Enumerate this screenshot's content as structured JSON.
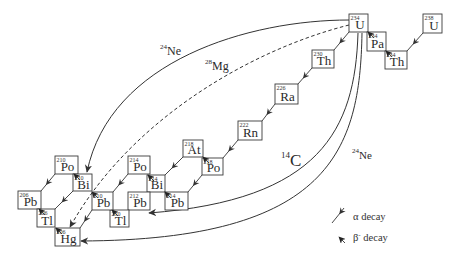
{
  "diagram": {
    "nuclides": [
      {
        "mass": "234",
        "symbol": "U"
      },
      {
        "mass": "234",
        "symbol": "Pa"
      },
      {
        "mass": "234",
        "symbol": "Th"
      },
      {
        "mass": "238",
        "symbol": "U"
      },
      {
        "mass": "230",
        "symbol": "Th"
      },
      {
        "mass": "226",
        "symbol": "Ra"
      },
      {
        "mass": "222",
        "symbol": "Rn"
      },
      {
        "mass": "218",
        "symbol": "At"
      },
      {
        "mass": "218",
        "symbol": "Po"
      },
      {
        "mass": "214",
        "symbol": "Po"
      },
      {
        "mass": "214",
        "symbol": "Bi"
      },
      {
        "mass": "214",
        "symbol": "Pb"
      },
      {
        "mass": "212",
        "symbol": "Pb"
      },
      {
        "mass": "210",
        "symbol": "Tl"
      },
      {
        "mass": "210",
        "symbol": "Pb"
      },
      {
        "mass": "210",
        "symbol": "Po"
      },
      {
        "mass": "210",
        "symbol": "Bi"
      },
      {
        "mass": "206",
        "symbol": "Pb"
      },
      {
        "mass": "206",
        "symbol": "Tl"
      },
      {
        "mass": "206",
        "symbol": "Hg"
      }
    ],
    "cluster_labels": [
      {
        "mass": "24",
        "symbol": "Ne"
      },
      {
        "mass": "28",
        "symbol": "Mg"
      },
      {
        "mass": "14",
        "symbol": "C"
      },
      {
        "mass": "24",
        "symbol": "Ne"
      }
    ],
    "legend": {
      "alpha": {
        "label": "α decay"
      },
      "beta": {
        "symbol": "β",
        "charge": "-",
        "label": " decay"
      }
    },
    "colors": {
      "line": "#333333",
      "background": "#ffffff"
    }
  }
}
